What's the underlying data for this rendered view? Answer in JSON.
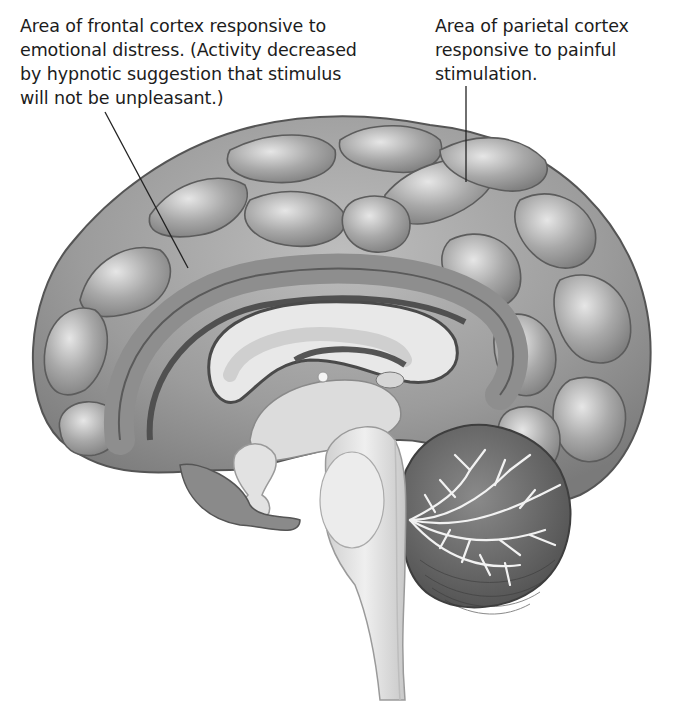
{
  "figure": {
    "annotations": [
      {
        "id": "frontal",
        "text": "Area of frontal cortex responsive to\nemotional distress. (Activity decreased\nby hypnotic suggestion that stimulus\nwill not be unpleasant.)",
        "target": "anterior cingulate / medial frontal cortex"
      },
      {
        "id": "parietal",
        "text": "Area of parietal cortex\nresponsive to painful\nstimulation.",
        "target": "parietal cortex"
      }
    ],
    "colors": {
      "cortex": "#9a9a9a",
      "cortex_light": "#c4c4c4",
      "sulcus": "#555555",
      "white_matter": "#e4e4e4",
      "brainstem": "#dedede",
      "cerebellum": "#707070",
      "leader_line": "#222222",
      "text": "#1c1c1c"
    }
  }
}
